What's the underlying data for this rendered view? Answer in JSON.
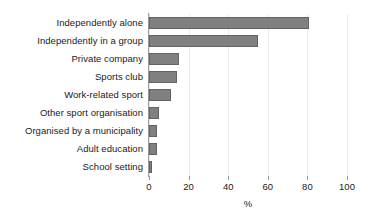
{
  "chart_data": {
    "type": "bar",
    "orientation": "horizontal",
    "title": "",
    "xlabel": "%",
    "ylabel": "",
    "xlim": [
      0,
      100
    ],
    "ylim": null,
    "grid": true,
    "legend": null,
    "xticks": [
      0,
      20,
      40,
      60,
      80,
      100
    ],
    "xtick_labels": [
      "0",
      "20",
      "40",
      "60",
      "80",
      "100"
    ],
    "categories": [
      "Independently alone",
      "Independently in a group",
      "Private company",
      "Sports club",
      "Work-related sport",
      "Other sport organisation",
      "Organised by a municipality",
      "Adult education",
      "School setting"
    ],
    "values": [
      81,
      55,
      15,
      14,
      11,
      5,
      4,
      4,
      1.5
    ],
    "bar_color": "#808080",
    "bar_edge_color": "#636363",
    "axis_color": "#9a9a9a",
    "grid_color": "#ebebeb",
    "text_color": "#1a1a1a"
  }
}
